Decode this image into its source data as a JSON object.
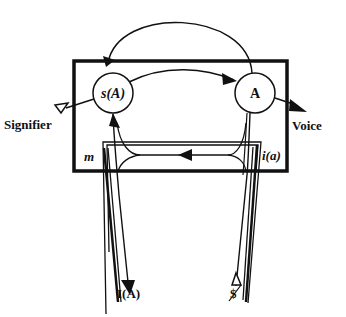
{
  "diagram": {
    "nodes": {
      "signified_node": {
        "label": "s(A)"
      },
      "other_node": {
        "label": "A"
      }
    },
    "labels": {
      "signifier": "Signifier",
      "voice": "Voice",
      "m": "m",
      "i_a": "i(a)",
      "ideal": "I(A)",
      "barred_subject": "$"
    },
    "colors": {
      "line": "#111111",
      "background": "#ffffff"
    }
  }
}
